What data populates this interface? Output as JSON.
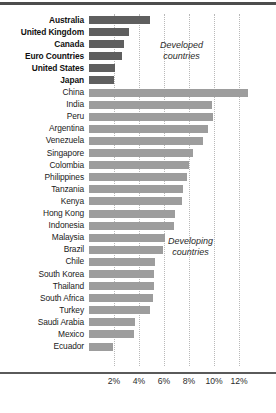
{
  "chart_data": {
    "type": "bar",
    "orientation": "horizontal",
    "title": "",
    "xlabel": "",
    "ylabel": "",
    "xlim": [
      0,
      13
    ],
    "xticks": [
      2,
      4,
      6,
      8,
      10,
      12
    ],
    "xtick_labels": [
      "2%",
      "4%",
      "6%",
      "8%",
      "10%",
      "12%"
    ],
    "grid": "vertical-dotted",
    "legend": "none",
    "annotations": [
      {
        "text_line1": "Developed",
        "text_line2": "countries"
      },
      {
        "text_line1": "Developing",
        "text_line2": "countries"
      }
    ],
    "groups": [
      {
        "name": "Developed countries",
        "color": "#5f5f5f",
        "categories": [
          "Australia",
          "United Kingdom",
          "Canada",
          "Euro Countries",
          "United States",
          "Japan"
        ],
        "values": [
          4.9,
          3.2,
          2.8,
          2.6,
          2.1,
          2.0
        ]
      },
      {
        "name": "Developing countries",
        "color": "#9d9d9d",
        "categories": [
          "China",
          "India",
          "Peru",
          "Argentina",
          "Venezuela",
          "Singapore",
          "Colombia",
          "Philippines",
          "Tanzania",
          "Kenya",
          "Hong Kong",
          "Indonesia",
          "Malaysia",
          "Brazil",
          "Chile",
          "South Korea",
          "Thailand",
          "South Africa",
          "Turkey",
          "Saudi Arabia",
          "Mexico",
          "Ecuador"
        ],
        "values": [
          12.7,
          9.8,
          9.9,
          9.5,
          9.1,
          8.3,
          8.0,
          7.8,
          7.5,
          7.4,
          6.9,
          6.8,
          6.1,
          5.9,
          5.3,
          5.2,
          5.2,
          5.1,
          4.9,
          3.7,
          3.6,
          1.9
        ]
      }
    ],
    "categories": [
      "Australia",
      "United Kingdom",
      "Canada",
      "Euro Countries",
      "United States",
      "Japan",
      "China",
      "India",
      "Peru",
      "Argentina",
      "Venezuela",
      "Singapore",
      "Colombia",
      "Philippines",
      "Tanzania",
      "Kenya",
      "Hong Kong",
      "Indonesia",
      "Malaysia",
      "Brazil",
      "Chile",
      "South Korea",
      "Thailand",
      "South Africa",
      "Turkey",
      "Saudi Arabia",
      "Mexico",
      "Ecuador"
    ],
    "values": [
      4.9,
      3.2,
      2.8,
      2.6,
      2.1,
      2.0,
      12.7,
      9.8,
      9.9,
      9.5,
      9.1,
      8.3,
      8.0,
      7.8,
      7.5,
      7.4,
      6.9,
      6.8,
      6.1,
      5.9,
      5.3,
      5.2,
      5.2,
      5.1,
      4.9,
      3.7,
      3.6,
      1.9
    ],
    "series_group": [
      "developed",
      "developed",
      "developed",
      "developed",
      "developed",
      "developed",
      "developing",
      "developing",
      "developing",
      "developing",
      "developing",
      "developing",
      "developing",
      "developing",
      "developing",
      "developing",
      "developing",
      "developing",
      "developing",
      "developing",
      "developing",
      "developing",
      "developing",
      "developing",
      "developing",
      "developing",
      "developing",
      "developing"
    ]
  },
  "colors": {
    "developed_bar": "#5f5f5f",
    "developing_bar": "#9d9d9d",
    "gridline": "#b9b9b9",
    "axis_rule": "#5a5a5a",
    "top_rule": "#4d4d4d",
    "label_text": "#1a1a1a"
  },
  "annot_developed": {
    "line1": "Developed",
    "line2": "countries"
  },
  "annot_developing": {
    "line1": "Developing",
    "line2": "countries"
  }
}
